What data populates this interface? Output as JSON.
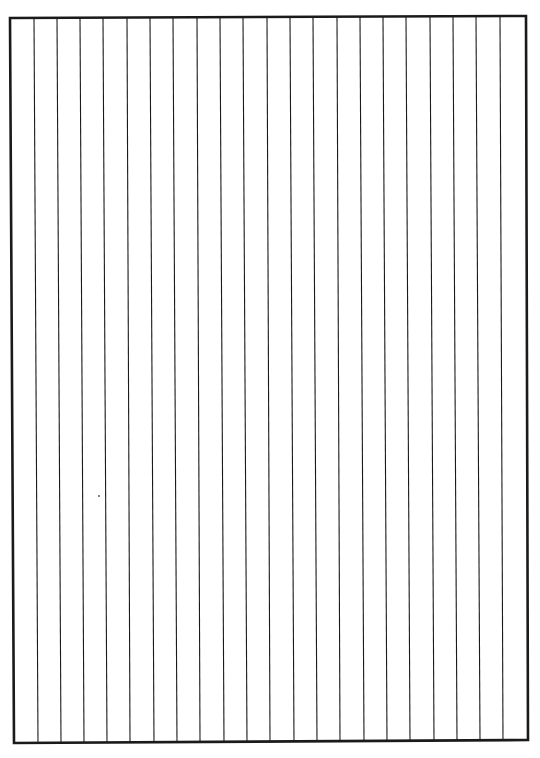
{
  "page": {
    "width": 540,
    "height": 758,
    "background": "#ffffff",
    "ink_color": "#1a1a1a",
    "border": {
      "top_left": [
        10,
        18
      ],
      "top_right": [
        526,
        16
      ],
      "bottom_right": [
        528,
        740
      ],
      "bottom_left": [
        14,
        743
      ],
      "stroke_width": 2.6
    },
    "vertical_rules": {
      "count": 21,
      "stroke_width": 1.1,
      "top_x": [
        34,
        57,
        80,
        103,
        127,
        150,
        173,
        197,
        220,
        243,
        267,
        290,
        313,
        337,
        360,
        383,
        406,
        430,
        453,
        476,
        500
      ],
      "bottom_x": [
        38,
        61,
        84,
        107,
        130,
        154,
        177,
        200,
        224,
        247,
        270,
        294,
        317,
        340,
        364,
        387,
        410,
        434,
        457,
        480,
        503
      ]
    },
    "stray_marks": [
      {
        "x": 99,
        "y": 496,
        "r": 1.1
      }
    ]
  }
}
